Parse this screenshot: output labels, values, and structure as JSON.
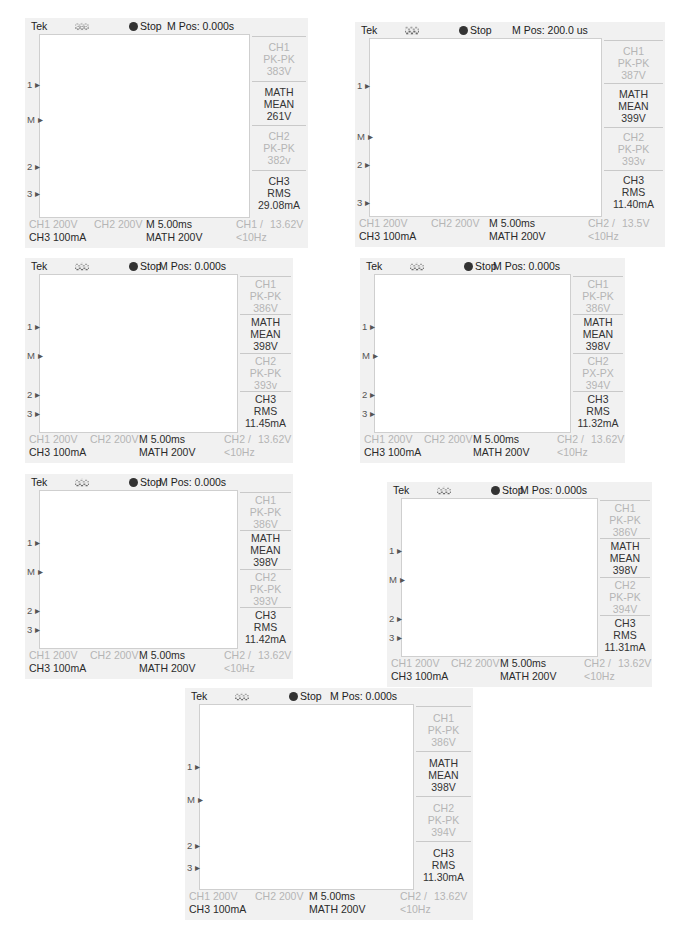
{
  "common": {
    "brand": "Tek",
    "run_state": "Stop",
    "trigger_icon": "pulse-edge-icon",
    "ch1_scale": "CH1 200V",
    "ch2_scale": "CH2 200V",
    "ch3_scale": "CH3 100mA",
    "timebase": "M 5.00ms",
    "math_scale": "MATH 200V",
    "freq": "<10Hz",
    "colors": {
      "ch1": "#a6a6a6",
      "math": "#2b2b2b",
      "ch2": "#6e6e6e",
      "ch3": "#555555",
      "grid": "#d6d6d6"
    }
  },
  "panels": [
    {
      "id": "p1",
      "mpos": "M Pos: 0.000s",
      "trig_src": "CH1 /",
      "trig_level": "13.62V",
      "ch1": {
        "title": "CH1",
        "meas": "PK-PK",
        "value": "383V"
      },
      "math": {
        "title": "MATH",
        "meas": "MEAN",
        "value": "261V"
      },
      "ch2": {
        "title": "CH2",
        "meas": "PK-PK",
        "value": "382v"
      },
      "ch3": {
        "title": "CH3",
        "meas": "RMS",
        "value": "29.08mA"
      }
    },
    {
      "id": "p2",
      "mpos": "M Pos: 200.0 us",
      "trig_src": "CH2 /",
      "trig_level": "13.5V",
      "ch1": {
        "title": "CH1",
        "meas": "PK-PK",
        "value": "387V"
      },
      "math": {
        "title": "MATH",
        "meas": "MEAN",
        "value": "399V"
      },
      "ch2": {
        "title": "CH2",
        "meas": "PK-PK",
        "value": "393v"
      },
      "ch3": {
        "title": "CH3",
        "meas": "RMS",
        "value": "11.40mA"
      }
    },
    {
      "id": "p3",
      "mpos": "M Pos: 0.000s",
      "trig_src": "CH2 /",
      "trig_level": "13.62V",
      "ch1": {
        "title": "CH1",
        "meas": "PK-PK",
        "value": "386V"
      },
      "math": {
        "title": "MATH",
        "meas": "MEAN",
        "value": "398V"
      },
      "ch2": {
        "title": "CH2",
        "meas": "PK-PK",
        "value": "393v"
      },
      "ch3": {
        "title": "CH3",
        "meas": "RMS",
        "value": "11.45mA"
      }
    },
    {
      "id": "p4",
      "mpos": "M Pos: 0.000s",
      "trig_src": "CH2 /",
      "trig_level": "13.62V",
      "ch1": {
        "title": "CH1",
        "meas": "PK-PK",
        "value": "386V"
      },
      "math": {
        "title": "MATH",
        "meas": "MEAN",
        "value": "398V"
      },
      "ch2": {
        "title": "CH2",
        "meas": "PX-PX",
        "value": "394V"
      },
      "ch3": {
        "title": "CH3",
        "meas": "RMS",
        "value": "11.32mA"
      }
    },
    {
      "id": "p5",
      "mpos": "M Pos: 0.000s",
      "trig_src": "CH2 /",
      "trig_level": "13.62V",
      "ch1": {
        "title": "CH1",
        "meas": "PK-PK",
        "value": "386V"
      },
      "math": {
        "title": "MATH",
        "meas": "MEAN",
        "value": "398V"
      },
      "ch2": {
        "title": "CH2",
        "meas": "PK-PK",
        "value": "393V"
      },
      "ch3": {
        "title": "CH3",
        "meas": "RMS",
        "value": "11.42mA"
      }
    },
    {
      "id": "p6",
      "mpos": "M Pos: 0.000s",
      "trig_src": "CH2 /",
      "trig_level": "13.62V",
      "ch1": {
        "title": "CH1",
        "meas": "PK-PK",
        "value": "386V"
      },
      "math": {
        "title": "MATH",
        "meas": "MEAN",
        "value": "398V"
      },
      "ch2": {
        "title": "CH2",
        "meas": "PK-PK",
        "value": "394V"
      },
      "ch3": {
        "title": "CH3",
        "meas": "RMS",
        "value": "11.31mA"
      }
    },
    {
      "id": "p7",
      "mpos": "M Pos: 0.000s",
      "trig_src": "CH2 /",
      "trig_level": "13.62V",
      "ch1": {
        "title": "CH1",
        "meas": "PK-PK",
        "value": "386V"
      },
      "math": {
        "title": "MATH",
        "meas": "MEAN",
        "value": "398V"
      },
      "ch2": {
        "title": "CH2",
        "meas": "PK-PK",
        "value": "394V"
      },
      "ch3": {
        "title": "CH3",
        "meas": "RMS",
        "value": "11.30mA"
      }
    }
  ],
  "chart_data": [
    {
      "type": "line",
      "title": "Oscilloscope capture 1 (M Pos: 0.000s)",
      "xlabel": "time (5.00 ms/div)",
      "ylabel": "CH1/CH2 200V/div, MATH 200V/div, CH3 100mA/div",
      "grid": true,
      "x_divisions": 10,
      "y_divisions": 8,
      "series": [
        {
          "name": "CH1",
          "measurement": "PK-PK",
          "value": "383V",
          "shape": "distorted square wave"
        },
        {
          "name": "MATH",
          "measurement": "MEAN",
          "value": "261V",
          "shape": "noisy with periodic negative spikes"
        },
        {
          "name": "CH2",
          "measurement": "PK-PK",
          "value": "382v",
          "shape": "distorted square wave, inverted"
        },
        {
          "name": "CH3",
          "measurement": "RMS",
          "value": "29.08mA",
          "shape": "spiky current"
        }
      ]
    },
    {
      "type": "line",
      "title": "Oscilloscope capture 2 (M Pos: 200.0 us)",
      "xlabel": "time (5.00 ms/div)",
      "grid": true,
      "series": [
        {
          "name": "CH1",
          "measurement": "PK-PK",
          "value": "387V",
          "shape": "rounded square wave"
        },
        {
          "name": "MATH",
          "measurement": "MEAN",
          "value": "399V"
        },
        {
          "name": "CH2",
          "measurement": "PK-PK",
          "value": "393v",
          "shape": "rounded square wave, complementary"
        },
        {
          "name": "CH3",
          "measurement": "RMS",
          "value": "11.40mA"
        }
      ]
    },
    {
      "type": "line",
      "title": "Oscilloscope capture 3",
      "grid": true,
      "series": [
        {
          "name": "CH1",
          "measurement": "PK-PK",
          "value": "386V",
          "shape": "square wave"
        },
        {
          "name": "MATH",
          "measurement": "MEAN",
          "value": "398V"
        },
        {
          "name": "CH2",
          "measurement": "PK-PK",
          "value": "393v",
          "shape": "square wave"
        },
        {
          "name": "CH3",
          "measurement": "RMS",
          "value": "11.45mA"
        }
      ]
    },
    {
      "type": "line",
      "title": "Oscilloscope capture 4",
      "grid": true,
      "series": [
        {
          "name": "CH1",
          "measurement": "PK-PK",
          "value": "386V"
        },
        {
          "name": "MATH",
          "measurement": "MEAN",
          "value": "398V"
        },
        {
          "name": "CH2",
          "measurement": "PX-PX",
          "value": "394V"
        },
        {
          "name": "CH3",
          "measurement": "RMS",
          "value": "11.32mA"
        }
      ]
    },
    {
      "type": "line",
      "title": "Oscilloscope capture 5",
      "grid": true,
      "series": [
        {
          "name": "CH1",
          "measurement": "PK-PK",
          "value": "386V"
        },
        {
          "name": "MATH",
          "measurement": "MEAN",
          "value": "398V"
        },
        {
          "name": "CH2",
          "measurement": "PK-PK",
          "value": "393V"
        },
        {
          "name": "CH3",
          "measurement": "RMS",
          "value": "11.42mA"
        }
      ]
    },
    {
      "type": "line",
      "title": "Oscilloscope capture 6",
      "grid": true,
      "series": [
        {
          "name": "CH1",
          "measurement": "PK-PK",
          "value": "386V"
        },
        {
          "name": "MATH",
          "measurement": "MEAN",
          "value": "398V"
        },
        {
          "name": "CH2",
          "measurement": "PK-PK",
          "value": "394V"
        },
        {
          "name": "CH3",
          "measurement": "RMS",
          "value": "11.31mA"
        }
      ]
    },
    {
      "type": "line",
      "title": "Oscilloscope capture 7",
      "grid": true,
      "series": [
        {
          "name": "CH1",
          "measurement": "PK-PK",
          "value": "386V"
        },
        {
          "name": "MATH",
          "measurement": "MEAN",
          "value": "398V"
        },
        {
          "name": "CH2",
          "measurement": "PK-PK",
          "value": "394V"
        },
        {
          "name": "CH3",
          "measurement": "RMS",
          "value": "11.30mA"
        }
      ]
    }
  ]
}
